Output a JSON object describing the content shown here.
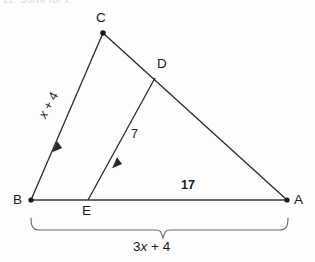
{
  "figure": {
    "type": "geometry-diagram",
    "header_fragment": "22.  Solve for x.",
    "background_color": "#fdfdfd",
    "stroke_color": "#2a2a2a",
    "text_color": "#1a1a1a",
    "vertices": [
      {
        "id": "A",
        "label": "A",
        "x": 287,
        "y": 200,
        "label_x": 294,
        "label_y": 194,
        "dot": true
      },
      {
        "id": "B",
        "label": "B",
        "x": 31,
        "y": 200,
        "label_x": 14,
        "label_y": 194,
        "dot": true
      },
      {
        "id": "C",
        "label": "C",
        "x": 103,
        "y": 33,
        "label_x": 97,
        "label_y": 12,
        "dot": true
      },
      {
        "id": "D",
        "label": "D",
        "x": 155,
        "y": 78,
        "label_x": 158,
        "label_y": 57,
        "dot": false
      },
      {
        "id": "E",
        "label": "E",
        "x": 88,
        "y": 200,
        "label_x": 83,
        "label_y": 205,
        "dot": false
      }
    ],
    "segments": [
      {
        "name": "segment-BC",
        "from": "B",
        "to": "C",
        "arrow_marks": 1
      },
      {
        "name": "segment-CA",
        "from": "C",
        "to": "A",
        "arrow_marks": 0
      },
      {
        "name": "segment-BA",
        "from": "B",
        "to": "A",
        "arrow_marks": 0
      },
      {
        "name": "segment-ED",
        "from": "E",
        "to": "D",
        "arrow_marks": 1
      }
    ],
    "measure_labels": [
      {
        "name": "label-bc",
        "text": "x + 4",
        "italic_part": "x",
        "rest": " + 4",
        "on_segment": "BC",
        "x": 38,
        "y": 98,
        "rotated": true,
        "rotation_deg": -62
      },
      {
        "name": "label-ed",
        "text": "7",
        "on_segment": "ED",
        "x": 132,
        "y": 134,
        "rotated": false
      },
      {
        "name": "label-ea",
        "text": "17",
        "on_segment": "EA",
        "x": 183,
        "y": 180,
        "rotated": false
      }
    ],
    "brace": {
      "name": "length-brace-BA",
      "left_x": 31,
      "right_x": 288,
      "top_y": 218,
      "bar_y": 230,
      "notch_x": 163,
      "notch_y": 238,
      "label": "3x + 4",
      "label_italic_part": "3",
      "label_var": "x",
      "label_rest": " + 4",
      "label_x": 133,
      "label_y": 240
    }
  }
}
